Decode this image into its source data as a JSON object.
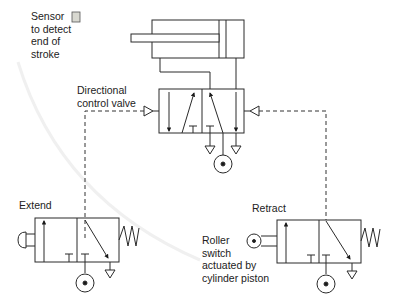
{
  "diagram": {
    "labels": {
      "sensor": "Sensor\nto detect\nend of\nstroke",
      "dcv": "Directional\ncontrol valve",
      "extend": "Extend",
      "retract": "Retract",
      "roller": "Roller\nswitch\nactuated by\ncylinder piston"
    },
    "components": [
      {
        "id": "cylinder",
        "type": "double-acting cylinder"
      },
      {
        "id": "sensor",
        "type": "end-of-stroke sensor"
      },
      {
        "id": "dcv",
        "type": "5/2 pilot-operated directional control valve"
      },
      {
        "id": "extend-valve",
        "type": "3/2 push-button valve, spring return"
      },
      {
        "id": "retract-valve",
        "type": "3/2 roller-operated valve, spring return"
      }
    ],
    "colors": {
      "line": "#2a2a2a",
      "sensor_fill": "#d8d8d0",
      "arc": "#f2f2f2"
    }
  }
}
